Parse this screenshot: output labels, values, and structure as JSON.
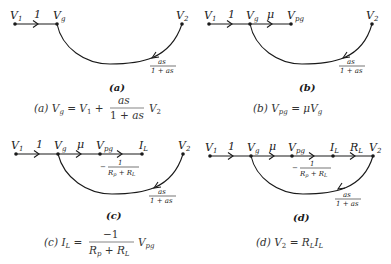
{
  "figure": {
    "panels": [
      {
        "id": "a",
        "caption": "(a)",
        "nodes": [
          "V1",
          "Vg",
          "V2"
        ],
        "branches": [
          {
            "from": "V1",
            "to": "Vg",
            "gain": "1"
          },
          {
            "from": "V2",
            "to": "Vg",
            "gain": "as/(1 + as)"
          }
        ],
        "equation": {
          "tag": "(a)",
          "lhs": "Vg",
          "rhs_text": "V1 + as/(1 + as) V2",
          "frac_num": "as",
          "frac_den": "1 + as"
        }
      },
      {
        "id": "b",
        "caption": "(b)",
        "nodes": [
          "V1",
          "Vg",
          "Vpg",
          "V2"
        ],
        "branches": [
          {
            "from": "V1",
            "to": "Vg",
            "gain": "1"
          },
          {
            "from": "Vg",
            "to": "Vpg",
            "gain": "μ"
          },
          {
            "from": "V2",
            "to": "Vg",
            "gain": "as/(1 + as)"
          }
        ],
        "equation": {
          "tag": "(b)",
          "lhs": "Vpg",
          "rhs_text": "μVg"
        }
      },
      {
        "id": "c",
        "caption": "(c)",
        "nodes": [
          "V1",
          "Vg",
          "Vpg",
          "IL",
          "V2"
        ],
        "branches": [
          {
            "from": "V1",
            "to": "Vg",
            "gain": "1"
          },
          {
            "from": "Vg",
            "to": "Vpg",
            "gain": "μ"
          },
          {
            "from": "Vpg",
            "to": "IL",
            "gain": "-1/(Rp + RL)"
          },
          {
            "from": "V2",
            "to": "Vg",
            "gain": "as/(1 + as)"
          }
        ],
        "equation": {
          "tag": "(c)",
          "lhs": "IL",
          "rhs_text": "-1/(Rp + RL) Vpg",
          "frac_num": "−1",
          "frac_den": "Rp + RL"
        }
      },
      {
        "id": "d",
        "caption": "(d)",
        "nodes": [
          "V1",
          "Vg",
          "Vpg",
          "IL",
          "V2"
        ],
        "branches": [
          {
            "from": "V1",
            "to": "Vg",
            "gain": "1"
          },
          {
            "from": "Vg",
            "to": "Vpg",
            "gain": "μ"
          },
          {
            "from": "Vpg",
            "to": "IL",
            "gain": "-1/(Rp + RL)"
          },
          {
            "from": "IL",
            "to": "V2",
            "gain": "RL"
          },
          {
            "from": "V2",
            "to": "Vg",
            "gain": "as/(1 + as)"
          }
        ],
        "equation": {
          "tag": "(d)",
          "lhs": "V2",
          "rhs_text": "RL IL"
        }
      }
    ],
    "labels": {
      "gain_one": "1",
      "gain_mu": "μ",
      "feedback_num": "as",
      "feedback_den": "1 + as",
      "load_num": "1",
      "load_den": "Rp + RL",
      "minus": "−",
      "plus": "+",
      "equals": "="
    }
  }
}
